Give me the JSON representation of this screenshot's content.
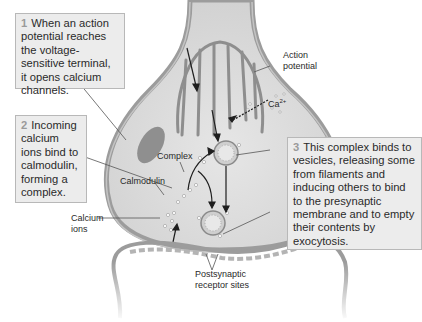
{
  "callouts": [
    {
      "number": "1",
      "text": "When an action potential reaches the voltage-sensitive terminal, it opens calcium channels."
    },
    {
      "number": "2",
      "text": "Incoming calcium ions bind to calmodulin, forming a complex."
    },
    {
      "number": "3",
      "text": "This complex binds to vesicles, releasing some from filaments and inducing others to bind to the presynaptic membrane and to empty their contents by exocytosis."
    }
  ],
  "labels": {
    "action_potential_line1": "Action",
    "action_potential_line2": "potential",
    "ca_base": "Ca",
    "ca_charge": "2+",
    "complex": "Complex",
    "calmodulin": "Calmodulin",
    "calcium_ions_line1": "Calcium",
    "calcium_ions_line2": "ions",
    "postsynaptic_line1": "Postsynaptic",
    "postsynaptic_line2": "receptor sites"
  },
  "colors": {
    "membrane": "#9c9c9c",
    "cytoplasm": "#d9d9d9",
    "callout_bg": "#ececec",
    "number": "#9a9a9a"
  }
}
